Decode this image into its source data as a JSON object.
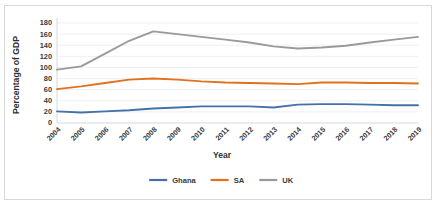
{
  "chart_data": {
    "type": "line",
    "title": "",
    "xlabel": "Year",
    "ylabel": "Percentage of GDP",
    "categories": [
      "2004",
      "2005",
      "2006",
      "2007",
      "2008",
      "2009",
      "2010",
      "2011",
      "2012",
      "2013",
      "2014",
      "2015",
      "2016",
      "2017",
      "2018",
      "2019"
    ],
    "yticks": [
      0,
      20,
      40,
      60,
      80,
      100,
      120,
      140,
      160,
      180
    ],
    "ylim": [
      0,
      180
    ],
    "grid": true,
    "legend_position": "bottom",
    "series": [
      {
        "name": "Ghana",
        "color": "#4472a8",
        "values": [
          21,
          19,
          21,
          23,
          26,
          28,
          30,
          30,
          30,
          28,
          33,
          34,
          34,
          33,
          32,
          32
        ]
      },
      {
        "name": "SA",
        "color": "#e2711d",
        "values": [
          61,
          66,
          72,
          78,
          80,
          78,
          75,
          73,
          72,
          71,
          70,
          73,
          73,
          72,
          72,
          71
        ]
      },
      {
        "name": "UK",
        "color": "#9a9a9a",
        "values": [
          96,
          102,
          125,
          148,
          165,
          160,
          155,
          150,
          145,
          138,
          134,
          136,
          139,
          145,
          150,
          155
        ]
      }
    ]
  }
}
